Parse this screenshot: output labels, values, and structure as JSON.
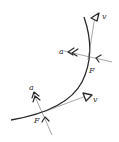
{
  "diagram": {
    "title": "",
    "colors": {
      "curve": "#2a2a2a",
      "vector_line": "#6a6a6a",
      "label": "#333333",
      "background": "#ffffff"
    },
    "points": [
      {
        "id": "upper",
        "labels": {
          "velocity": "v",
          "acceleration": "a",
          "force": "F"
        }
      },
      {
        "id": "lower",
        "labels": {
          "velocity": "v",
          "acceleration": "a",
          "force": "F"
        }
      }
    ]
  }
}
